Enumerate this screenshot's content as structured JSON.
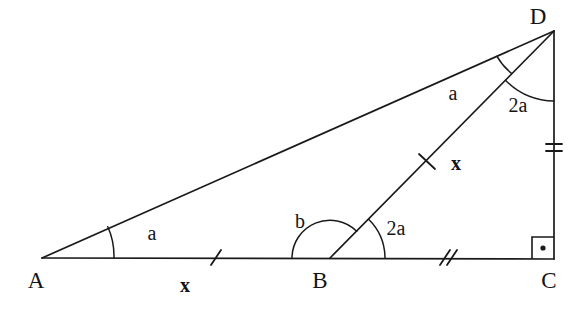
{
  "figure": {
    "background_color": "#ffffff",
    "stroke_color": "#1a1a1a",
    "width": 580,
    "height": 312
  },
  "vertices": [
    {
      "id": "A",
      "label": "A",
      "x": 42,
      "y": 258,
      "label_x": 36,
      "label_y": 288
    },
    {
      "id": "B",
      "label": "B",
      "x": 330,
      "y": 258,
      "label_x": 317,
      "label_y": 288
    },
    {
      "id": "C",
      "label": "C",
      "x": 552,
      "y": 258,
      "label_x": 545,
      "label_y": 288
    },
    {
      "id": "D",
      "label": "D",
      "x": 554,
      "y": 31,
      "label_x": 534,
      "label_y": 22
    }
  ],
  "segments": [
    {
      "id": "AD",
      "from": "A",
      "to": "D",
      "tick_count": 0
    },
    {
      "id": "AC",
      "from": "A",
      "to": "C",
      "tick_count": 0
    },
    {
      "id": "BD",
      "from": "B",
      "to": "D",
      "tick_count": 1
    },
    {
      "id": "DC",
      "from": "D",
      "to": "C",
      "tick_count": 2
    }
  ],
  "side_length_labels": [
    {
      "id": "AB-length",
      "text": "x",
      "x": 185,
      "y": 291,
      "segment": "AB"
    },
    {
      "id": "BD-length",
      "text": "x",
      "x": 450,
      "y": 170,
      "segment": "BD"
    }
  ],
  "tick_marks": [
    {
      "id": "tick-AB",
      "segment": "AB",
      "count": 1,
      "x": 216,
      "y": 258,
      "angle_deg": 0
    },
    {
      "id": "tick-BC",
      "segment": "BC",
      "count": 2,
      "x": 446,
      "y": 258,
      "angle_deg": 0
    },
    {
      "id": "tick-BD",
      "segment": "BD",
      "count": 1,
      "x": 427,
      "y": 161,
      "angle_deg": -45
    },
    {
      "id": "tick-DC",
      "segment": "DC",
      "count": 2,
      "x": 554,
      "y": 147,
      "angle_deg": 90
    }
  ],
  "angles": [
    {
      "id": "angle-A",
      "vertex": "A",
      "label": "a",
      "label_x": 150,
      "label_y": 240,
      "radius": 72,
      "description": "angle DAC at vertex A"
    },
    {
      "id": "angle-ABD",
      "vertex": "B",
      "label": "b",
      "label_x": 296,
      "label_y": 228,
      "radius": 38,
      "description": "obtuse angle ABD at vertex B, left side"
    },
    {
      "id": "angle-DBC",
      "vertex": "B",
      "label": "2a",
      "label_x": 390,
      "label_y": 234,
      "radius": 55,
      "description": "angle DBC at vertex B, right side"
    },
    {
      "id": "angle-ADB",
      "vertex": "D",
      "label": "a",
      "label_x": 448,
      "label_y": 100,
      "radius": 62,
      "description": "angle ADB at vertex D"
    },
    {
      "id": "angle-BDC",
      "vertex": "D",
      "label": "2a",
      "label_x": 508,
      "label_y": 112,
      "radius": 70,
      "description": "angle BDC at vertex D"
    }
  ],
  "right_angle": {
    "id": "right-angle-C",
    "vertex": "C",
    "size": 22,
    "has_center_dot": true,
    "description": "right angle marker at vertex C with dot"
  }
}
